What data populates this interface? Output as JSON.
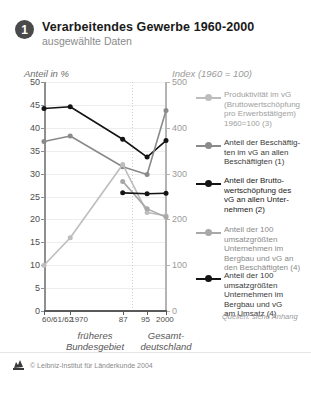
{
  "header": {
    "badge": "1",
    "title": "Verarbeitendes Gewerbe 1960-2000",
    "subtitle": "ausgewählte Daten"
  },
  "axis_captions": {
    "left": "Anteil in %",
    "right": "Index (1960 = 100)"
  },
  "groups": {
    "left": "früheres\nBundesgebiet",
    "left_l1": "früheres",
    "left_l2": "Bundesgebiet",
    "right_l1": "Gesamt-",
    "right_l2": "deutschland"
  },
  "source_note": "Quellen: siehe Anhang",
  "footer": "© Leibniz-Institut für Länderkunde 2004",
  "colors": {
    "black": "#141414",
    "dark_gray": "#4d4d4d",
    "mid_gray": "#8a8a8a",
    "light_gray": "#a8a8a8",
    "pale_gray": "#bdbdbd",
    "grid": "#ededed",
    "axis_left": "#8f8f8f",
    "axis_right": "#b4b4b4"
  },
  "legend": [
    {
      "marker_color": "#bdbdbd",
      "label": "Produktivität im vG (Bruttowertschöpfung pro Erwerbstätigem) 1960=100 (3)",
      "lines": [
        "Produktivität im vG",
        "(Bruttowertschöpfung",
        "pro Erwerbstätigem)",
        "1960=100 (3)"
      ],
      "text_color": "#a0a0a0"
    },
    {
      "marker_color": "#8a8a8a",
      "label": "Anteil der Beschäftigten im vG an allen Beschäftigten (1)",
      "lines": [
        "Anteil der Beschäftig-",
        "ten im vG an allen",
        "Beschäftigten (1)"
      ],
      "text_color": "#3a3a3a"
    },
    {
      "marker_color": "#141414",
      "label": "Anteil der Bruttowertschöpfung des vG an allen Unternehmen (2)",
      "lines": [
        "Anteil der Brutto-",
        "wertschöpfung des",
        "vG an allen Unter-",
        "nehmen (2)"
      ],
      "text_color": "#1a1a1a"
    },
    {
      "marker_color": "#a8a8a8",
      "label": "Anteil der 100 umsatzgrößten Unternehmen im Bergbau und vG an den Beschäftigten (4)",
      "lines": [
        "Anteil der 100",
        "umsatzgrößten",
        "Unternehmen im",
        "Bergbau und vG an",
        "den Beschäftigten (4)"
      ],
      "text_color": "#8a8a8a"
    },
    {
      "marker_color": "#141414",
      "label": "Anteil der 100 umsatzgrößten Unternehmen im Bergbau und vG am Umsatz (4)",
      "lines": [
        "Anteil der 100",
        "umsatzgrößten",
        "Unternehmen im",
        "Bergbau und vG",
        "am Umsatz (4)"
      ],
      "text_color": "#3a3a3a"
    }
  ],
  "chart_data": {
    "type": "line",
    "title": "Verarbeitendes Gewerbe 1960-2000",
    "subtitle": "ausgewählte Daten",
    "xlabel": "",
    "ylabel": "Anteil in %",
    "y2label": "Index (1960 = 100)",
    "ylim": [
      0,
      50
    ],
    "y2lim": [
      0,
      500
    ],
    "yticks": [
      0,
      5,
      10,
      15,
      20,
      25,
      30,
      35,
      40,
      45,
      50
    ],
    "y2ticks": [
      0,
      100,
      200,
      300,
      400,
      500
    ],
    "grid": true,
    "legend_position": "right",
    "x": [
      "60/61/62",
      "1970",
      "87",
      "95",
      "2000"
    ],
    "xtick_labels": [
      "60/61/62",
      "1970",
      "87",
      "95",
      "2000"
    ],
    "group_divider_after": "87",
    "series": [
      {
        "name": "Anteil der Bruttowertschöpfung des vG an allen Unternehmen (2)",
        "axis": "left",
        "color": "#141414",
        "values": [
          44.2,
          44.6,
          37.5,
          33.6,
          37.2
        ]
      },
      {
        "name": "Anteil der Beschäftigten im vG an allen Beschäftigten (1)",
        "axis": "left",
        "color": "#8a8a8a",
        "values": [
          37.0,
          38.2,
          31.5,
          29.8,
          43.8
        ]
      },
      {
        "name": "Produktivität im vG (Bruttowertschöpfung pro Erwerbstätigem) 1960=100 (3)",
        "axis": "right",
        "color": "#bdbdbd",
        "values": [
          100,
          160,
          320,
          215,
          208
        ]
      },
      {
        "name": "Anteil der 100 umsatzgrößten Unternehmen im Bergbau und vG an den Beschäftigten (4)",
        "axis": "left",
        "color": "#a8a8a8",
        "values": [
          null,
          null,
          28.3,
          22.3,
          20.5
        ]
      },
      {
        "name": "Anteil der 100 umsatzgrößten Unternehmen im Bergbau und vG am Umsatz (4)",
        "axis": "left",
        "color": "#141414",
        "values": [
          null,
          null,
          25.8,
          25.6,
          25.7
        ]
      }
    ]
  }
}
